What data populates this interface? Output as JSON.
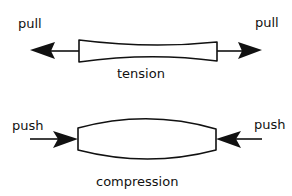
{
  "diagram": {
    "tension": {
      "label": "tension",
      "left_force": "pull",
      "right_force": "pull"
    },
    "compression": {
      "label": "compression",
      "left_force": "push",
      "right_force": "push"
    }
  },
  "colors": {
    "stroke": "#111111",
    "fill": "#ffffff"
  }
}
